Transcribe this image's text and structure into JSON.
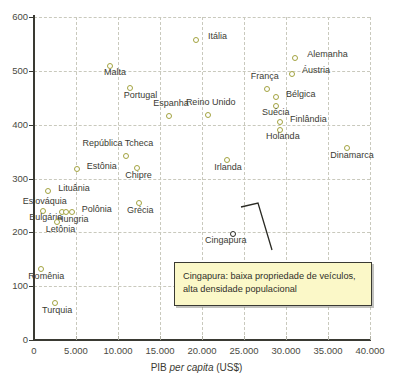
{
  "chart_data": {
    "type": "scatter",
    "title": "",
    "xlabel": "PIB per capita (US$)",
    "ylabel": "",
    "xlim": [
      0,
      40000
    ],
    "ylim": [
      0,
      600
    ],
    "grid": true,
    "legend_position": "none",
    "xticks": [
      "0",
      "5.000",
      "10.000",
      "15.000",
      "20.000",
      "25.000",
      "30.000",
      "35.000",
      "40.000"
    ],
    "xtick_values": [
      0,
      5000,
      10000,
      15000,
      20000,
      25000,
      30000,
      35000,
      40000
    ],
    "yticks": [
      "0",
      "100",
      "200",
      "300",
      "400",
      "500",
      "600"
    ],
    "ytick_values": [
      0,
      100,
      200,
      300,
      400,
      500,
      600
    ],
    "xlabel_prefix": "PIB ",
    "xlabel_italic": "per capita",
    "xlabel_suffix": " (US$)",
    "points": [
      {
        "label": "Itália",
        "x": 19300,
        "y": 557,
        "lx": 12,
        "ly": -4
      },
      {
        "label": "Alemanha",
        "x": 31100,
        "y": 524,
        "lx": 12,
        "ly": -4
      },
      {
        "label": "Áustria",
        "x": 30700,
        "y": 494,
        "lx": 10,
        "ly": -4
      },
      {
        "label": "Malta",
        "x": 9050,
        "y": 509,
        "lx": -6,
        "ly": 6
      },
      {
        "label": "Portugal",
        "x": 11400,
        "y": 468,
        "lx": -6,
        "ly": 7
      },
      {
        "label": "França",
        "x": 27700,
        "y": 466,
        "lx": -16,
        "ly": -13
      },
      {
        "label": "Bélgica",
        "x": 28800,
        "y": 451,
        "lx": 10,
        "ly": -3
      },
      {
        "label": "Suécia",
        "x": 28800,
        "y": 435,
        "lx": -14,
        "ly": 6
      },
      {
        "label": "Espanha",
        "x": 16100,
        "y": 416,
        "lx": -16,
        "ly": -13
      },
      {
        "label": "Reino Unido",
        "x": 20700,
        "y": 418,
        "lx": -22,
        "ly": -13
      },
      {
        "label": "Finlândia",
        "x": 29300,
        "y": 405,
        "lx": 10,
        "ly": -3
      },
      {
        "label": "Holanda",
        "x": 29300,
        "y": 391,
        "lx": -14,
        "ly": 6
      },
      {
        "label": "Dinamarca",
        "x": 37300,
        "y": 357,
        "lx": -17,
        "ly": 7
      },
      {
        "label": "República Tcheca",
        "x": 11000,
        "y": 341,
        "lx": -44,
        "ly": -13
      },
      {
        "label": "Irlanda",
        "x": 23000,
        "y": 334,
        "lx": -13,
        "ly": 7
      },
      {
        "label": "Chipre",
        "x": 12300,
        "y": 320,
        "lx": -12,
        "ly": 7
      },
      {
        "label": "Estônia",
        "x": 5100,
        "y": 317,
        "lx": 10,
        "ly": -3
      },
      {
        "label": "Lituânia",
        "x": 1700,
        "y": 277,
        "lx": 10,
        "ly": -3
      },
      {
        "label": "Grécia",
        "x": 12500,
        "y": 254,
        "lx": -12,
        "ly": 7
      },
      {
        "label": "Eslováquia",
        "x": 3300,
        "y": 238,
        "lx": -39,
        "ly": -11
      },
      {
        "label": "Polônia",
        "x": 4500,
        "y": 238,
        "lx": 10,
        "ly": -3
      },
      {
        "label": "Hungria",
        "x": 3800,
        "y": 238,
        "lx": -9,
        "ly": 7
      },
      {
        "label": "Bulgária",
        "x": 1100,
        "y": 240,
        "lx": -14,
        "ly": 6
      },
      {
        "label": "Letônia",
        "x": 2700,
        "y": 219,
        "lx": -11,
        "ly": 7
      },
      {
        "label": "Romênia",
        "x": 850,
        "y": 132,
        "lx": -13,
        "ly": 7
      },
      {
        "label": "Turquia",
        "x": 2500,
        "y": 69,
        "lx": -13,
        "ly": 7
      },
      {
        "label": "Cingapura",
        "x": 23700,
        "y": 196,
        "lx": -28,
        "ly": 6,
        "highlight": true
      }
    ],
    "annotation": {
      "line1": "Cingapura: baixa propriedade de veículos,",
      "line2": "alta densidade populacional"
    }
  }
}
